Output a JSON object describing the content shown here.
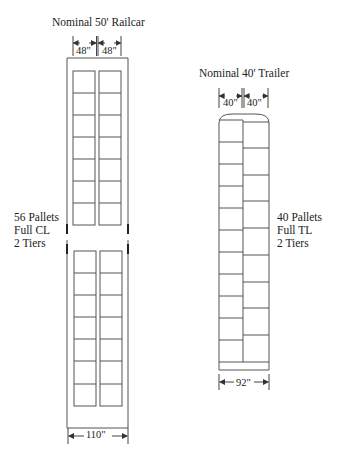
{
  "railcar": {
    "title": "Nominal 50' Railcar",
    "pallet_width_left": "48\"",
    "pallet_width_right": "48\"",
    "overall_width": "110\"",
    "label": [
      "56 Pallets",
      "Full CL",
      "2 Tiers"
    ],
    "columns": 2,
    "rows_per_section": 7,
    "sections": 2
  },
  "trailer": {
    "title": "Nominal 40' Trailer",
    "pallet_width_left": "40\"",
    "pallet_width_right": "40\"",
    "overall_width": "92\"",
    "label": [
      "40 Pallets",
      "Full TL",
      "2 Tiers"
    ],
    "left_column_rows": 10,
    "right_column_rows": 10
  },
  "colors": {
    "line": "#555555",
    "text": "#222222",
    "background": "#ffffff"
  }
}
